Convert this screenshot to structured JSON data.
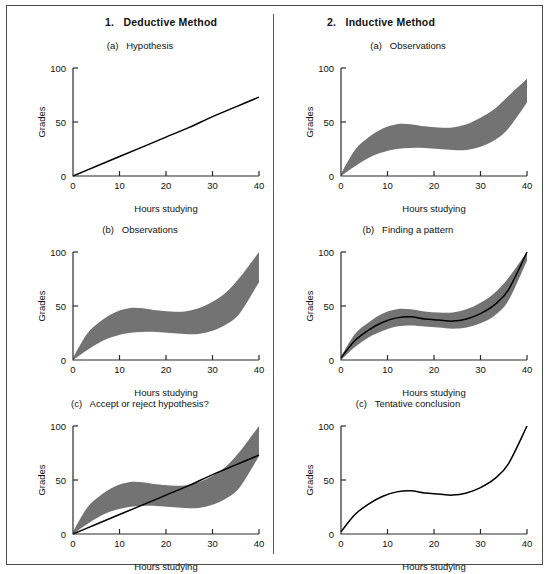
{
  "figure": {
    "columns": [
      {
        "label": "1.   Deductive Method"
      },
      {
        "label": "2.   Inductive Method"
      }
    ]
  },
  "axes": {
    "xlabel": "Hours studying",
    "ylabel": "Grades",
    "xticks": [
      "0",
      "10",
      "20",
      "30",
      "40"
    ],
    "yticks": [
      "0",
      "50",
      "100"
    ],
    "xlim": [
      0,
      40
    ],
    "ylim": [
      0,
      100
    ]
  },
  "style": {
    "band_fill": "#737373",
    "line_color": "#000000",
    "axis_color": "#2b2b2b",
    "frame_color": "#4a4a4a",
    "background": "#ffffff"
  },
  "chart_data": [
    {
      "id": "panel-1a",
      "type": "line",
      "column": "1. Deductive Method",
      "subtitle": "(a)   Hypothesis",
      "title": "Hypothesis",
      "xlabel": "Hours studying",
      "ylabel": "Grades",
      "xlim": [
        0,
        40
      ],
      "ylim": [
        0,
        100
      ],
      "grid": false,
      "legend": "none",
      "series": [
        {
          "name": "hypothesis",
          "kind": "line",
          "x": [
            0,
            5,
            10,
            15,
            20,
            25,
            30,
            35,
            40
          ],
          "values": [
            0,
            9,
            18,
            27,
            36,
            45,
            55,
            64,
            73
          ]
        }
      ]
    },
    {
      "id": "panel-1b",
      "type": "area",
      "column": "1. Deductive Method",
      "subtitle": "(b)   Observations",
      "title": "Observations",
      "xlabel": "Hours studying",
      "ylabel": "Grades",
      "xlim": [
        0,
        40
      ],
      "ylim": [
        0,
        100
      ],
      "grid": false,
      "legend": "none",
      "series": [
        {
          "name": "observations-band",
          "kind": "band",
          "x": [
            0,
            3,
            6,
            9,
            12,
            15,
            18,
            21,
            24,
            27,
            30,
            33,
            36,
            40
          ],
          "upper": [
            2,
            24,
            36,
            44,
            48,
            48,
            46,
            45,
            45,
            48,
            54,
            63,
            77,
            100
          ],
          "lower": [
            0,
            9,
            17,
            22,
            25,
            26,
            26,
            25,
            24,
            24,
            27,
            33,
            44,
            72
          ]
        }
      ]
    },
    {
      "id": "panel-1c",
      "type": "area",
      "column": "1. Deductive Method",
      "subtitle": "(c)   Accept or reject hypothesis?",
      "title": "Accept or reject hypothesis?",
      "xlabel": "Hours studying",
      "ylabel": "Grades",
      "xlim": [
        0,
        40
      ],
      "ylim": [
        0,
        100
      ],
      "grid": false,
      "legend": "none",
      "series": [
        {
          "name": "observations-band",
          "kind": "band",
          "x": [
            0,
            3,
            6,
            9,
            12,
            15,
            18,
            21,
            24,
            27,
            30,
            33,
            36,
            40
          ],
          "upper": [
            2,
            24,
            36,
            44,
            48,
            48,
            46,
            45,
            45,
            48,
            54,
            63,
            77,
            100
          ],
          "lower": [
            0,
            9,
            17,
            22,
            25,
            26,
            26,
            25,
            24,
            24,
            27,
            33,
            44,
            72
          ]
        },
        {
          "name": "hypothesis",
          "kind": "line",
          "x": [
            0,
            5,
            10,
            15,
            20,
            25,
            30,
            35,
            40
          ],
          "values": [
            0,
            9,
            18,
            27,
            36,
            45,
            55,
            64,
            73
          ]
        }
      ]
    },
    {
      "id": "panel-2a",
      "type": "area",
      "column": "2. Inductive Method",
      "subtitle": "(a)   Observations",
      "title": "Observations",
      "xlabel": "Hours studying",
      "ylabel": "Grades",
      "xlim": [
        0,
        40
      ],
      "ylim": [
        0,
        100
      ],
      "grid": false,
      "legend": "none",
      "series": [
        {
          "name": "observations-band",
          "kind": "band",
          "x": [
            0,
            3,
            6,
            9,
            12,
            15,
            18,
            21,
            24,
            27,
            30,
            33,
            36,
            40
          ],
          "upper": [
            2,
            24,
            36,
            44,
            48,
            48,
            46,
            45,
            45,
            48,
            54,
            62,
            74,
            90
          ],
          "lower": [
            0,
            9,
            17,
            22,
            25,
            26,
            26,
            25,
            24,
            24,
            27,
            33,
            44,
            68
          ]
        }
      ]
    },
    {
      "id": "panel-2b",
      "type": "area",
      "column": "2. Inductive Method",
      "subtitle": "(b)   Finding a pattern",
      "title": "Finding a pattern",
      "xlabel": "Hours studying",
      "ylabel": "Grades",
      "xlim": [
        0,
        40
      ],
      "ylim": [
        0,
        100
      ],
      "grid": false,
      "legend": "none",
      "series": [
        {
          "name": "observations-band",
          "kind": "band",
          "x": [
            0,
            3,
            6,
            9,
            12,
            15,
            18,
            21,
            24,
            27,
            30,
            33,
            36,
            40
          ],
          "upper": [
            3,
            24,
            35,
            43,
            47,
            47,
            45,
            44,
            44,
            47,
            53,
            62,
            76,
            100
          ],
          "lower": [
            0,
            12,
            21,
            27,
            31,
            32,
            31,
            30,
            29,
            30,
            34,
            41,
            55,
            92
          ]
        },
        {
          "name": "pattern-curve",
          "kind": "line",
          "x": [
            0,
            3,
            6,
            9,
            12,
            15,
            18,
            21,
            24,
            27,
            30,
            33,
            36,
            40
          ],
          "values": [
            2,
            18,
            28,
            35,
            39,
            40,
            38,
            37,
            36,
            38,
            43,
            51,
            65,
            100
          ]
        }
      ]
    },
    {
      "id": "panel-2c",
      "type": "line",
      "column": "2. Inductive Method",
      "subtitle": "(c)   Tentative conclusion",
      "title": "Tentative conclusion",
      "xlabel": "Hours studying",
      "ylabel": "Grades",
      "xlim": [
        0,
        40
      ],
      "ylim": [
        0,
        100
      ],
      "grid": false,
      "legend": "none",
      "series": [
        {
          "name": "conclusion-curve",
          "kind": "line",
          "x": [
            0,
            3,
            6,
            9,
            12,
            15,
            18,
            21,
            24,
            27,
            30,
            33,
            36,
            40
          ],
          "values": [
            2,
            18,
            28,
            35,
            39,
            40,
            38,
            37,
            36,
            38,
            43,
            51,
            65,
            100
          ]
        }
      ]
    }
  ]
}
